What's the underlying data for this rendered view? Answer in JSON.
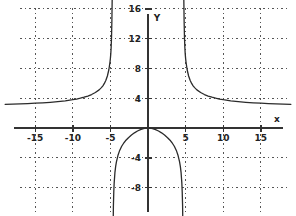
{
  "chart_data": {
    "type": "line",
    "title": "",
    "xlabel": "x",
    "ylabel": "Y",
    "grid": true,
    "legend": null,
    "xlim": [
      -19,
      19.5
    ],
    "ylim": [
      -12,
      19
    ],
    "xticks": [
      -15,
      -10,
      -5,
      5,
      10,
      15
    ],
    "yticks": [
      4,
      8,
      12,
      16,
      -4,
      -8
    ],
    "xtick_labels": [
      "-15",
      "-10",
      "-5",
      "5",
      "10",
      "15"
    ],
    "ytick_labels": [
      "4",
      "8",
      "12",
      "16",
      "-4",
      "-8"
    ],
    "gridlines_x": [
      -15,
      -10,
      -5,
      5,
      10,
      15
    ],
    "gridlines_y": [
      16,
      12,
      8,
      4,
      -4,
      -8
    ],
    "asymptotes": {
      "vertical": [
        -4.7,
        4.7
      ],
      "horizontal": [
        3
      ]
    },
    "series": [
      {
        "name": "left-branch",
        "comment": "x from -19 to -4.8, rises from y~3 asymptotically to +inf",
        "points": [
          [
            -19.0,
            3.18
          ],
          [
            -18.0,
            3.21
          ],
          [
            -17.0,
            3.24
          ],
          [
            -16.0,
            3.28
          ],
          [
            -15.0,
            3.33
          ],
          [
            -14.0,
            3.38
          ],
          [
            -13.0,
            3.45
          ],
          [
            -12.0,
            3.54
          ],
          [
            -11.0,
            3.65
          ],
          [
            -10.0,
            3.8
          ],
          [
            -9.5,
            3.89
          ],
          [
            -9.0,
            4.0
          ],
          [
            -8.5,
            4.13
          ],
          [
            -8.0,
            4.29
          ],
          [
            -7.5,
            4.49
          ],
          [
            -7.0,
            4.76
          ],
          [
            -6.5,
            5.12
          ],
          [
            -6.2,
            5.42
          ],
          [
            -6.0,
            5.66
          ],
          [
            -5.8,
            5.98
          ],
          [
            -5.6,
            6.4
          ],
          [
            -5.4,
            6.98
          ],
          [
            -5.2,
            7.85
          ],
          [
            -5.05,
            8.88
          ],
          [
            -5.0,
            9.35
          ],
          [
            -4.95,
            9.95
          ],
          [
            -4.9,
            10.8
          ],
          [
            -4.85,
            12.2
          ],
          [
            -4.8,
            14.5
          ],
          [
            -4.76,
            17.5
          ],
          [
            -4.74,
            19.5
          ]
        ]
      },
      {
        "name": "middle-branch",
        "comment": "x from -4.6 to 4.6, dome peaking at (0,0) falling to -inf",
        "points": [
          [
            -4.62,
            -12.0
          ],
          [
            -4.6,
            -10.4
          ],
          [
            -4.55,
            -8.6
          ],
          [
            -4.5,
            -7.4
          ],
          [
            -4.4,
            -6.0
          ],
          [
            -4.3,
            -5.15
          ],
          [
            -4.2,
            -4.55
          ],
          [
            -4.0,
            -3.7
          ],
          [
            -3.8,
            -3.1
          ],
          [
            -3.5,
            -2.45
          ],
          [
            -3.2,
            -1.98
          ],
          [
            -3.0,
            -1.72
          ],
          [
            -2.6,
            -1.3
          ],
          [
            -2.2,
            -0.95
          ],
          [
            -1.8,
            -0.65
          ],
          [
            -1.4,
            -0.4
          ],
          [
            -1.0,
            -0.21
          ],
          [
            -0.6,
            -0.08
          ],
          [
            -0.3,
            -0.02
          ],
          [
            0.0,
            0.0
          ],
          [
            0.3,
            -0.02
          ],
          [
            0.6,
            -0.08
          ],
          [
            1.0,
            -0.21
          ],
          [
            1.4,
            -0.4
          ],
          [
            1.8,
            -0.65
          ],
          [
            2.2,
            -0.95
          ],
          [
            2.6,
            -1.3
          ],
          [
            3.0,
            -1.72
          ],
          [
            3.2,
            -1.98
          ],
          [
            3.5,
            -2.45
          ],
          [
            3.8,
            -3.1
          ],
          [
            4.0,
            -3.7
          ],
          [
            4.2,
            -4.55
          ],
          [
            4.3,
            -5.15
          ],
          [
            4.4,
            -6.0
          ],
          [
            4.5,
            -7.4
          ],
          [
            4.55,
            -8.6
          ],
          [
            4.6,
            -10.4
          ],
          [
            4.62,
            -12.0
          ]
        ]
      },
      {
        "name": "right-branch",
        "comment": "x from 4.8 to 19, falls from +inf asymptotically to y~3",
        "points": [
          [
            4.74,
            19.5
          ],
          [
            4.76,
            17.5
          ],
          [
            4.8,
            14.5
          ],
          [
            4.85,
            12.2
          ],
          [
            4.9,
            10.8
          ],
          [
            4.95,
            9.95
          ],
          [
            5.0,
            9.35
          ],
          [
            5.05,
            8.88
          ],
          [
            5.2,
            7.85
          ],
          [
            5.4,
            6.98
          ],
          [
            5.6,
            6.4
          ],
          [
            5.8,
            5.98
          ],
          [
            6.0,
            5.66
          ],
          [
            6.2,
            5.42
          ],
          [
            6.5,
            5.12
          ],
          [
            7.0,
            4.76
          ],
          [
            7.5,
            4.49
          ],
          [
            8.0,
            4.29
          ],
          [
            8.5,
            4.13
          ],
          [
            9.0,
            4.0
          ],
          [
            9.5,
            3.89
          ],
          [
            10.0,
            3.8
          ],
          [
            11.0,
            3.65
          ],
          [
            12.0,
            3.54
          ],
          [
            13.0,
            3.45
          ],
          [
            14.0,
            3.38
          ],
          [
            15.0,
            3.33
          ],
          [
            16.0,
            3.28
          ],
          [
            17.0,
            3.24
          ],
          [
            18.0,
            3.21
          ],
          [
            19.0,
            3.18
          ]
        ]
      }
    ]
  },
  "axes": {
    "x_axis_label": "x",
    "y_axis_label": "Y"
  }
}
